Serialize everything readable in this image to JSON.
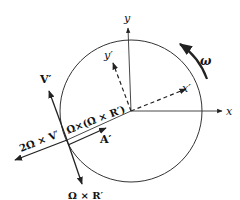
{
  "diagram": {
    "axes": {
      "x_label": "x",
      "y_label": "y",
      "x_prime_label": "x′",
      "y_prime_label": "y′"
    },
    "rotation_label": "ω",
    "vectors": {
      "velocity": "V′",
      "coriolis": "2Ω × V′",
      "centripetal": "Ω×(Ω × R′)",
      "acceleration": "A′",
      "transport": "Ω × R′"
    },
    "colors": {
      "stroke": "#222222",
      "background": "#ffffff"
    }
  }
}
